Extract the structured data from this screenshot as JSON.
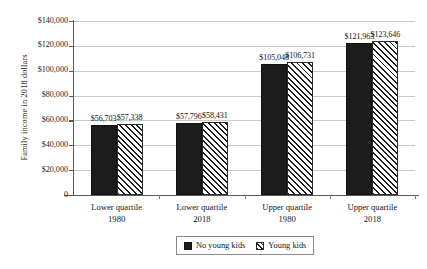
{
  "chart_data": {
    "type": "bar",
    "title": "",
    "xlabel": "",
    "ylabel": "Family income in 2018 dollars",
    "ylim": [
      0,
      140000
    ],
    "ytick_labels": [
      "$140,000",
      "$120,000",
      "$100,000",
      "$80,000",
      "$60,000",
      "$40,000",
      "$20,000",
      "0"
    ],
    "ytick_values": [
      140000,
      120000,
      100000,
      80000,
      60000,
      40000,
      20000,
      0
    ],
    "grid": true,
    "legend_position": "bottom",
    "categories": [
      {
        "line1": "Lower quartile",
        "line2": "1980"
      },
      {
        "line1": "Lower quartile",
        "line2": "2018"
      },
      {
        "line1": "Upper quartile",
        "line2": "1980"
      },
      {
        "line1": "Upper quartile",
        "line2": "2018"
      }
    ],
    "series": [
      {
        "name": "No young kids",
        "pattern": "solid",
        "color": "#1c1c1c",
        "values": [
          56703,
          57796,
          105048,
          121963
        ],
        "labels": [
          "$56,703",
          "$57,796",
          "$105,048",
          "$121,963"
        ]
      },
      {
        "name": "Young kids",
        "pattern": "hatch",
        "color": "#ffffff",
        "values": [
          57338,
          58431,
          106731,
          123646
        ],
        "labels": [
          "$57,338",
          "$58,431",
          "$106,731",
          "$123,646"
        ]
      }
    ]
  },
  "legend": {
    "items": [
      {
        "label": "No young kids"
      },
      {
        "label": "Young kids"
      }
    ]
  }
}
